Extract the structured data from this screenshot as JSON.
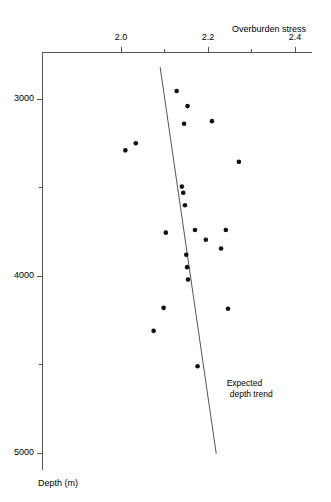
{
  "chart_data": {
    "type": "scatter",
    "title": "",
    "xlabel": "Overburden stress",
    "ylabel": "Depth (m)",
    "xlim": [
      1.93,
      2.44
    ],
    "ylim": [
      5130,
      2730
    ],
    "y_inverted": true,
    "grid": false,
    "legend": null,
    "xticks": [
      2.0,
      2.2,
      2.4
    ],
    "xticklabels": [
      "2.0",
      "2.2",
      "2.4"
    ],
    "xminorticks": [
      2.1,
      2.3
    ],
    "yticks": [
      3000,
      4000,
      5000
    ],
    "yticklabels": [
      "3000",
      "4000",
      "5000"
    ],
    "yminorticks": [
      3500,
      4500
    ],
    "points": [
      {
        "x": 2.128,
        "y": 2955
      },
      {
        "x": 2.153,
        "y": 3040
      },
      {
        "x": 2.01,
        "y": 3290
      },
      {
        "x": 2.034,
        "y": 3250
      },
      {
        "x": 2.145,
        "y": 3140
      },
      {
        "x": 2.209,
        "y": 3125
      },
      {
        "x": 2.271,
        "y": 3355
      },
      {
        "x": 2.14,
        "y": 3495
      },
      {
        "x": 2.143,
        "y": 3530
      },
      {
        "x": 2.147,
        "y": 3600
      },
      {
        "x": 2.103,
        "y": 3755
      },
      {
        "x": 2.17,
        "y": 3740
      },
      {
        "x": 2.195,
        "y": 3795
      },
      {
        "x": 2.241,
        "y": 3740
      },
      {
        "x": 2.23,
        "y": 3845
      },
      {
        "x": 2.15,
        "y": 3880
      },
      {
        "x": 2.152,
        "y": 3950
      },
      {
        "x": 2.154,
        "y": 4020
      },
      {
        "x": 2.098,
        "y": 4180
      },
      {
        "x": 2.246,
        "y": 4185
      },
      {
        "x": 2.075,
        "y": 4310
      },
      {
        "x": 2.176,
        "y": 4510
      }
    ],
    "trend_line": {
      "label": "Expected depth trend",
      "x_start": 2.09,
      "y_start": 2820,
      "x_end": 2.219,
      "y_end": 5005
    },
    "annotations": [
      {
        "text_line1": "Expected",
        "text_line2": "depth trend",
        "x": 2.243,
        "y": 4610
      }
    ],
    "axis_color": "#555555",
    "point_color": "#111111",
    "line_color": "#555555"
  }
}
